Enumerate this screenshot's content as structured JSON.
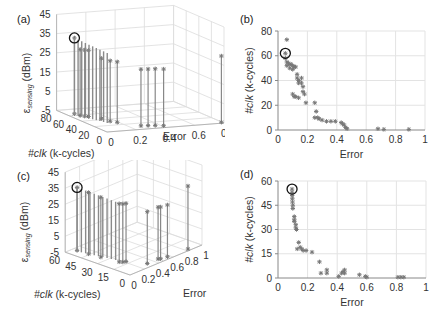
{
  "panels": {
    "a": {
      "label": "(a)"
    },
    "b": {
      "label": "(b)"
    },
    "c": {
      "label": "(c)"
    },
    "d": {
      "label": "(d)"
    }
  },
  "chart_data": [
    {
      "id": "a",
      "type": "scatter3d-stem",
      "title": "(a)",
      "xlabel": "Error",
      "ylabel": "#clk (k-cycles)",
      "zlabel": "ε_sensing (dBm)",
      "xticks": [
        "0",
        "0.2",
        "0.4",
        "0.6",
        "0.8"
      ],
      "yticks": [
        "0",
        "20",
        "40",
        "60",
        "80"
      ],
      "zticks": [
        "-5",
        "5",
        "15",
        "25",
        "35",
        "45"
      ],
      "grid": true,
      "highlight": {
        "error": 0.05,
        "clk": 62,
        "eps": 35
      },
      "stems": [
        {
          "error": 0.05,
          "clk": 62,
          "eps": 35
        },
        {
          "error": 0.06,
          "clk": 55,
          "eps": 30
        },
        {
          "error": 0.08,
          "clk": 52,
          "eps": 30
        },
        {
          "error": 0.1,
          "clk": 50,
          "eps": 30
        },
        {
          "error": 0.15,
          "clk": 40,
          "eps": 27
        },
        {
          "error": 0.17,
          "clk": 30,
          "eps": 27
        },
        {
          "error": 0.2,
          "clk": 25,
          "eps": 27
        },
        {
          "error": 0.3,
          "clk": 8,
          "eps": 25
        },
        {
          "error": 0.35,
          "clk": 7,
          "eps": 25
        },
        {
          "error": 0.4,
          "clk": 6,
          "eps": 25
        },
        {
          "error": 0.45,
          "clk": 3,
          "eps": 25
        },
        {
          "error": 0.88,
          "clk": 0,
          "eps": 30
        }
      ]
    },
    {
      "id": "b",
      "type": "scatter",
      "title": "(b)",
      "xlabel": "Error",
      "ylabel": "#clk (k-cycles)",
      "xticks": [
        "0",
        "0.2",
        "0.4",
        "0.6",
        "0.8",
        "1"
      ],
      "yticks": [
        "0",
        "20",
        "40",
        "60",
        "80"
      ],
      "xlim": [
        0,
        1
      ],
      "ylim": [
        0,
        80
      ],
      "grid": true,
      "highlight": {
        "x": 0.05,
        "y": 62
      },
      "points": [
        [
          0.06,
          73
        ],
        [
          0.05,
          62
        ],
        [
          0.05,
          58
        ],
        [
          0.06,
          55
        ],
        [
          0.07,
          54
        ],
        [
          0.08,
          53
        ],
        [
          0.09,
          53
        ],
        [
          0.1,
          52
        ],
        [
          0.11,
          51
        ],
        [
          0.12,
          51
        ],
        [
          0.06,
          52
        ],
        [
          0.08,
          50
        ],
        [
          0.1,
          49
        ],
        [
          0.13,
          45
        ],
        [
          0.13,
          42
        ],
        [
          0.14,
          40
        ],
        [
          0.14,
          38
        ],
        [
          0.16,
          42
        ],
        [
          0.16,
          38
        ],
        [
          0.17,
          35
        ],
        [
          0.17,
          31
        ],
        [
          0.18,
          29
        ],
        [
          0.1,
          29
        ],
        [
          0.11,
          27
        ],
        [
          0.12,
          27
        ],
        [
          0.14,
          26
        ],
        [
          0.19,
          22
        ],
        [
          0.25,
          22
        ],
        [
          0.26,
          15
        ],
        [
          0.25,
          10
        ],
        [
          0.27,
          10
        ],
        [
          0.28,
          9
        ],
        [
          0.3,
          8
        ],
        [
          0.33,
          7
        ],
        [
          0.36,
          7
        ],
        [
          0.39,
          7
        ],
        [
          0.43,
          6
        ],
        [
          0.44,
          5
        ],
        [
          0.45,
          4
        ],
        [
          0.46,
          2
        ],
        [
          0.47,
          1
        ],
        [
          0.68,
          1
        ],
        [
          0.72,
          0.5
        ],
        [
          0.89,
          0.5
        ]
      ]
    },
    {
      "id": "c",
      "type": "scatter3d-stem",
      "title": "(c)",
      "xlabel": "Error",
      "ylabel": "#clk (k-cycles)",
      "zlabel": "ε_sensing (dBm)",
      "xticks": [
        "0",
        "0.2",
        "0.4",
        "0.6",
        "0.8",
        "1"
      ],
      "yticks": [
        "0",
        "15",
        "30",
        "45",
        "60"
      ],
      "zticks": [
        "-5",
        "5",
        "15",
        "25",
        "35",
        "45"
      ],
      "grid": true,
      "highlight": {
        "error": 0.09,
        "clk": 55,
        "eps": 35
      },
      "stems": [
        {
          "error": 0.09,
          "clk": 55,
          "eps": 35
        },
        {
          "error": 0.1,
          "clk": 45,
          "eps": 34
        },
        {
          "error": 0.12,
          "clk": 35,
          "eps": 33
        },
        {
          "error": 0.15,
          "clk": 20,
          "eps": 32
        },
        {
          "error": 0.17,
          "clk": 18,
          "eps": 32
        },
        {
          "error": 0.2,
          "clk": 17,
          "eps": 32
        },
        {
          "error": 0.3,
          "clk": 4,
          "eps": 28
        },
        {
          "error": 0.45,
          "clk": 4,
          "eps": 28
        },
        {
          "error": 0.47,
          "clk": 3,
          "eps": 28
        },
        {
          "error": 0.55,
          "clk": 2,
          "eps": 28
        },
        {
          "error": 0.82,
          "clk": 1,
          "eps": 35
        }
      ]
    },
    {
      "id": "d",
      "type": "scatter",
      "title": "(d)",
      "xlabel": "Error",
      "ylabel": "#clk (k-cycles)",
      "xticks": [
        "0",
        "0.2",
        "0.4",
        "0.6",
        "0.8",
        "1"
      ],
      "yticks": [
        "0",
        "15",
        "30",
        "45",
        "60"
      ],
      "xlim": [
        0,
        1
      ],
      "ylim": [
        0,
        60
      ],
      "grid": true,
      "highlight": {
        "x": 0.095,
        "y": 55
      },
      "points": [
        [
          0.095,
          55
        ],
        [
          0.095,
          53
        ],
        [
          0.096,
          51
        ],
        [
          0.097,
          49
        ],
        [
          0.098,
          47
        ],
        [
          0.1,
          45
        ],
        [
          0.1,
          43
        ],
        [
          0.11,
          38
        ],
        [
          0.11,
          36
        ],
        [
          0.11,
          35
        ],
        [
          0.12,
          33
        ],
        [
          0.12,
          31
        ],
        [
          0.125,
          30
        ],
        [
          0.14,
          22
        ],
        [
          0.15,
          19
        ],
        [
          0.16,
          18
        ],
        [
          0.13,
          18
        ],
        [
          0.17,
          17
        ],
        [
          0.19,
          17
        ],
        [
          0.23,
          16
        ],
        [
          0.28,
          10
        ],
        [
          0.29,
          3
        ],
        [
          0.33,
          5
        ],
        [
          0.33,
          3
        ],
        [
          0.41,
          1
        ],
        [
          0.43,
          3
        ],
        [
          0.44,
          4
        ],
        [
          0.45,
          5
        ],
        [
          0.45,
          3
        ],
        [
          0.55,
          2
        ],
        [
          0.59,
          1
        ],
        [
          0.6,
          0.5
        ],
        [
          0.81,
          0.5
        ],
        [
          0.83,
          0.5
        ],
        [
          0.85,
          0.5
        ]
      ]
    }
  ]
}
